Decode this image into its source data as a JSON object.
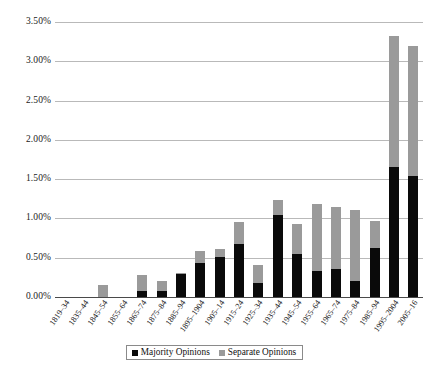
{
  "chart_data": {
    "type": "bar",
    "stacked": true,
    "title": "",
    "xlabel": "",
    "ylabel": "",
    "ylim": [
      0,
      3.5
    ],
    "ytick_labels": [
      "0.00%",
      "0.50%",
      "1.00%",
      "1.50%",
      "2.00%",
      "2.50%",
      "3.00%",
      "3.50%"
    ],
    "ytick_values": [
      0,
      0.5,
      1.0,
      1.5,
      2.0,
      2.5,
      3.0,
      3.5
    ],
    "grid": true,
    "legend_position": "bottom-center",
    "value_suffix": "%",
    "categories": [
      "1819–34",
      "1835–44",
      "1845–54",
      "1855–64",
      "1865–74",
      "1875–84",
      "1885–94",
      "1895–1904",
      "1905–14",
      "1915–24",
      "1925–34",
      "1935–44",
      "1945–54",
      "1955–64",
      "1965–74",
      "1975–84",
      "1985–94",
      "1995–2004",
      "2005–16"
    ],
    "series": [
      {
        "name": "Majority Opinions",
        "color": "#0a0a0a",
        "values": [
          0.0,
          0.0,
          0.0,
          0.0,
          0.08,
          0.08,
          0.29,
          0.43,
          0.51,
          0.67,
          0.18,
          1.04,
          0.55,
          0.33,
          0.36,
          0.21,
          0.63,
          1.65,
          1.54
        ]
      },
      {
        "name": "Separate Opinions",
        "color": "#9a9a9a",
        "values": [
          0.0,
          0.0,
          0.15,
          0.0,
          0.2,
          0.12,
          0.01,
          0.16,
          0.1,
          0.28,
          0.23,
          0.2,
          0.38,
          0.86,
          0.78,
          0.9,
          0.34,
          1.67,
          1.66
        ]
      }
    ],
    "totals": [
      0.0,
      0.0,
      0.15,
      0.0,
      0.28,
      0.2,
      0.3,
      0.59,
      0.61,
      0.95,
      0.41,
      1.24,
      0.93,
      1.19,
      1.14,
      1.11,
      0.97,
      3.32,
      3.2
    ]
  },
  "legend": {
    "items": [
      {
        "label": "Majority Opinions",
        "swatch": "black-square-icon"
      },
      {
        "label": "Separate Opinions",
        "swatch": "gray-square-icon"
      }
    ]
  }
}
